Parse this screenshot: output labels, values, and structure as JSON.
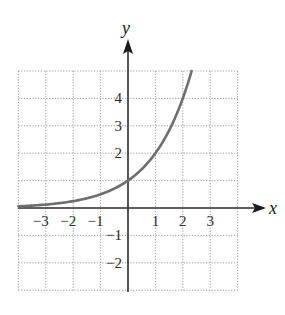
{
  "chart_data": {
    "type": "line",
    "title": "",
    "xlabel": "x",
    "ylabel": "y",
    "xlim": [
      -4,
      4
    ],
    "ylim": [
      -3,
      5
    ],
    "grid": true,
    "grid_style": "dotted",
    "legend": null,
    "x_ticks": [
      {
        "value": -3,
        "label": "−3"
      },
      {
        "value": -2,
        "label": "−2"
      },
      {
        "value": -1,
        "label": "−1"
      },
      {
        "value": 1,
        "label": "1"
      },
      {
        "value": 2,
        "label": "2"
      },
      {
        "value": 3,
        "label": "3"
      }
    ],
    "y_ticks": [
      {
        "value": 4,
        "label": "4"
      },
      {
        "value": 3,
        "label": "3"
      },
      {
        "value": 2,
        "label": "2"
      },
      {
        "value": -1,
        "label": "−1"
      },
      {
        "value": -2,
        "label": "−2"
      }
    ],
    "series": [
      {
        "name": "y = 2^x",
        "function": "2^x",
        "color": "#6e6e6e",
        "x": [
          -4,
          -3,
          -2,
          -1,
          0,
          1,
          2,
          2.32
        ],
        "y": [
          0.0625,
          0.125,
          0.25,
          0.5,
          1,
          2,
          4,
          5
        ]
      }
    ],
    "colors": {
      "axis": "#2b2b2b",
      "grid": "#9a9a9a",
      "curve": "#6e6e6e",
      "text": "#2a2a2a"
    }
  }
}
